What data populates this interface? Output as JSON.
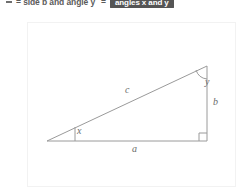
{
  "top_line": {
    "bullet": "dash-bullet",
    "text": "= side b and angle y",
    "equals": "=",
    "badge_label": "angles x and y",
    "badge_color": "#555555"
  },
  "diagram": {
    "name": "right-triangle",
    "stroke_color": "#9a9a9a",
    "labels": {
      "hypotenuse": "c",
      "base": "a",
      "height": "b",
      "angle_left": "x",
      "angle_top": "y"
    },
    "vertices": {
      "left": [
        47,
        141
      ],
      "bottom_right": [
        207,
        141
      ],
      "top_right": [
        207,
        66
      ]
    },
    "right_angle_marker": true
  }
}
